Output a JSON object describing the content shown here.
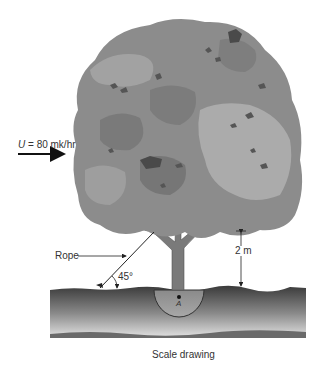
{
  "figure": {
    "wind_label": "U = 80 mk/hr",
    "wind_symbol": "U",
    "wind_value": "= 80 mk/hr",
    "rope_label": "Rope",
    "angle_label": "45°",
    "height_label": "2 m",
    "point_label": "A",
    "caption": "Scale drawing"
  },
  "colors": {
    "canopy_light": "#a9a9a9",
    "canopy_mid": "#8c8c8c",
    "canopy_dark": "#6e6e6e",
    "canopy_darkest": "#4a4a4a",
    "trunk": "#7a7a7a",
    "ground_top": "#3a3a3a",
    "ground_bottom": "#d8d8d8",
    "line": "#222222"
  }
}
